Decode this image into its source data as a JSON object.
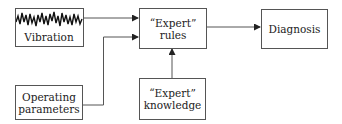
{
  "diagram": {
    "nodes": {
      "vibration": {
        "label": "Vibration",
        "icon": "vibration-waveform-icon"
      },
      "operating_parameters": {
        "line1": "Operating",
        "line2": "parameters"
      },
      "expert_rules": {
        "line1": "“Expert”",
        "line2": "rules"
      },
      "expert_knowledge": {
        "line1": "“Expert”",
        "line2": "knowledge"
      },
      "diagnosis": {
        "label": "Diagnosis"
      }
    },
    "edges": [
      {
        "from": "vibration",
        "to": "expert_rules"
      },
      {
        "from": "operating_parameters",
        "to": "expert_rules"
      },
      {
        "from": "expert_knowledge",
        "to": "expert_rules"
      },
      {
        "from": "expert_rules",
        "to": "diagnosis"
      }
    ],
    "colors": {
      "line": "#555555",
      "text": "#222222",
      "background": "#ffffff"
    }
  }
}
